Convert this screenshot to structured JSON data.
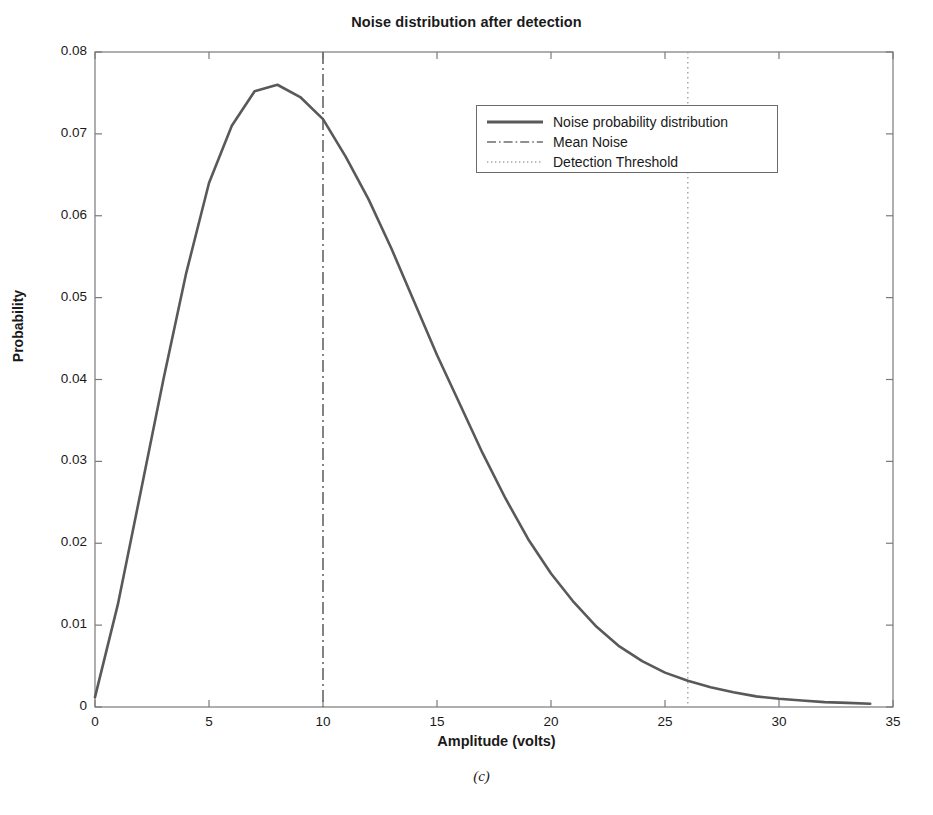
{
  "chart_data": {
    "type": "line",
    "title": "Noise distribution after detection",
    "xlabel": "Amplitude (volts)",
    "ylabel": "Probability",
    "subcaption": "(c)",
    "xlim": [
      0,
      35
    ],
    "ylim": [
      0,
      0.08
    ],
    "xticks": [
      0,
      5,
      10,
      15,
      20,
      25,
      30,
      35
    ],
    "xtick_labels": [
      "0",
      "5",
      "10",
      "15",
      "20",
      "25",
      "30",
      "35"
    ],
    "yticks": [
      0,
      0.01,
      0.02,
      0.03,
      0.04,
      0.05,
      0.06,
      0.07,
      0.08
    ],
    "ytick_labels": [
      "0",
      "0.01",
      "0.02",
      "0.03",
      "0.04",
      "0.05",
      "0.06",
      "0.07",
      "0.08"
    ],
    "grid": false,
    "legend_position": "upper right",
    "series": [
      {
        "name": "Noise probability distribution",
        "style": "solid",
        "color": "#595959",
        "x": [
          0,
          1,
          2,
          3,
          4,
          5,
          6,
          7,
          8,
          9,
          10,
          11,
          12,
          13,
          14,
          15,
          16,
          17,
          18,
          19,
          20,
          21,
          22,
          23,
          24,
          25,
          26,
          27,
          28,
          29,
          30,
          31,
          32,
          33,
          34
        ],
        "y": [
          0.0012,
          0.0125,
          0.0262,
          0.04,
          0.053,
          0.064,
          0.071,
          0.0752,
          0.076,
          0.0745,
          0.0718,
          0.0672,
          0.062,
          0.056,
          0.0495,
          0.043,
          0.037,
          0.031,
          0.0255,
          0.0205,
          0.0163,
          0.0128,
          0.0098,
          0.0074,
          0.0056,
          0.0042,
          0.0032,
          0.0024,
          0.0018,
          0.0013,
          0.001,
          0.0008,
          0.0006,
          0.0005,
          0.0004
        ]
      }
    ],
    "vlines": [
      {
        "name": "Mean Noise",
        "style": "dashdot",
        "color": "#6e6e6e",
        "x": 10
      },
      {
        "name": "Detection Threshold",
        "style": "dotted",
        "color": "#a6a6a6",
        "x": 26
      }
    ],
    "legend": [
      {
        "label": "Noise probability distribution",
        "style": "solid",
        "color": "#595959"
      },
      {
        "label": "Mean Noise",
        "style": "dashdot",
        "color": "#6e6e6e"
      },
      {
        "label": "Detection Threshold",
        "style": "dotted",
        "color": "#a6a6a6"
      }
    ],
    "axes_color": "#7a7a7a"
  }
}
